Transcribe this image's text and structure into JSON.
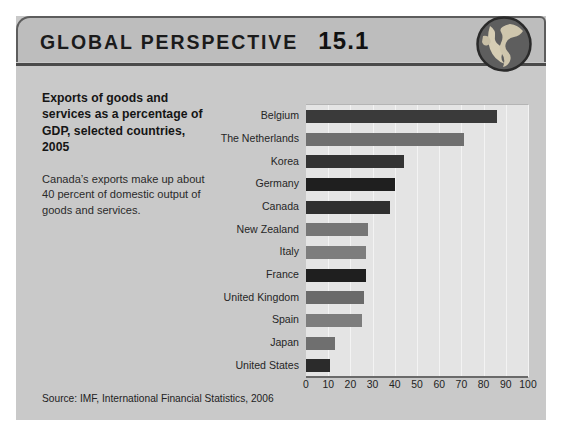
{
  "header": {
    "title": "GLOBAL PERSPECTIVE",
    "number": "15.1",
    "globe_icon": "globe-icon"
  },
  "caption": {
    "heading": "Exports of goods and services as a percentage of GDP, selected countries, 2005",
    "body": "Canada’s exports make up about 40 percent of domestic output of goods and services."
  },
  "source": "Source: IMF, International Financial Statistics, 2006",
  "colors": {
    "page_background": "#ffffff",
    "card_background": "#c9c9c9",
    "header_background": "#bdbdbd",
    "plot_background": "#e4e4e4",
    "gridline": "#f3f3f3",
    "axis": "#6a6a6a",
    "bar_dark": "#3a3a3a",
    "bar_darkest": "#1f1f1f",
    "bar_medium": "#6f6f6f",
    "bar_light": "#7d7d7d"
  },
  "chart_data": {
    "type": "bar",
    "orientation": "horizontal",
    "title": "Exports of goods and services as a percentage of GDP, selected countries, 2005",
    "xlabel": "",
    "ylabel": "",
    "xlim": [
      0,
      100
    ],
    "xticks": [
      0,
      10,
      20,
      30,
      40,
      50,
      60,
      70,
      80,
      90,
      100
    ],
    "grid": true,
    "legend": "none",
    "categories": [
      "Belgium",
      "The Netherlands",
      "Korea",
      "Germany",
      "Canada",
      "New Zealand",
      "Italy",
      "France",
      "United Kingdom",
      "Spain",
      "Japan",
      "United States"
    ],
    "values": [
      86,
      71,
      44,
      40,
      38,
      28,
      27,
      27,
      26,
      25,
      13,
      11
    ],
    "bar_colors": [
      "#3a3a3a",
      "#6f6f6f",
      "#333333",
      "#1f1f1f",
      "#2f2f2f",
      "#767676",
      "#7d7d7d",
      "#1f1f1f",
      "#6a6a6a",
      "#7d7d7d",
      "#6f6f6f",
      "#2b2b2b"
    ]
  }
}
